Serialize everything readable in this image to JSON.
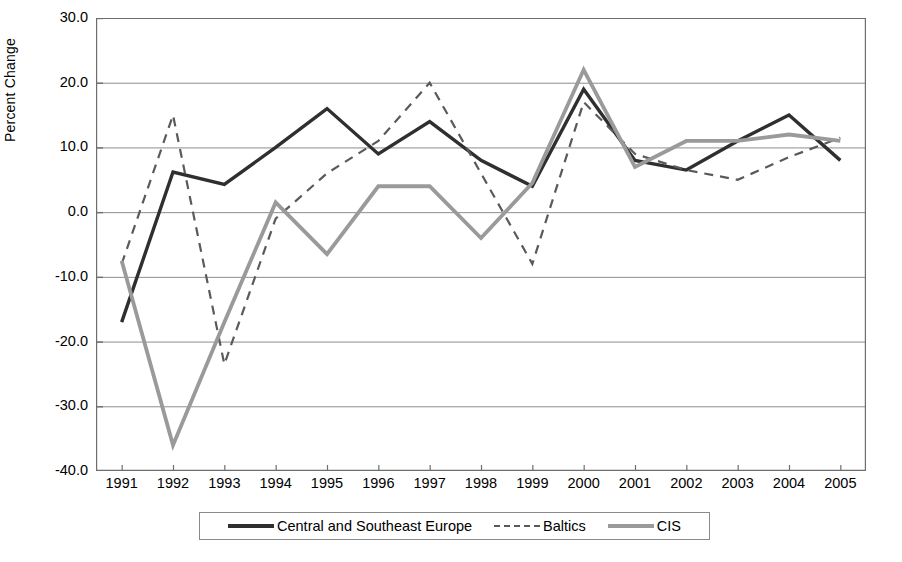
{
  "chart_data": {
    "type": "line",
    "title": "",
    "xlabel": "",
    "ylabel": "Percent Change",
    "ylim": [
      -40.0,
      30.0
    ],
    "xlim": [
      1991,
      2005
    ],
    "grid": true,
    "legend_position": "bottom",
    "ytick_labels": [
      "30.0",
      "20.0",
      "10.0",
      "0.0",
      "-10.0",
      "-20.0",
      "-30.0",
      "-40.0"
    ],
    "ytick_values": [
      30,
      20,
      10,
      0,
      -10,
      -20,
      -30,
      -40
    ],
    "categories": [
      1991,
      1992,
      1993,
      1994,
      1995,
      1996,
      1997,
      1998,
      1999,
      2000,
      2001,
      2002,
      2003,
      2004,
      2005
    ],
    "xtick_labels": [
      "1991",
      "1992",
      "1993",
      "1994",
      "1995",
      "1996",
      "1997",
      "1998",
      "1999",
      "2000",
      "2001",
      "2002",
      "2003",
      "2004",
      "2005"
    ],
    "series": [
      {
        "name": "Central and Southeast Europe",
        "style": "solid",
        "color": "#2f2f2f",
        "width": 3.4,
        "values": [
          -17.0,
          6.2,
          4.3,
          10.0,
          16.0,
          9.0,
          14.0,
          8.0,
          4.0,
          19.0,
          8.0,
          6.5,
          11.0,
          15.0,
          8.0
        ]
      },
      {
        "name": "Baltics",
        "style": "dashed",
        "color": "#5a5a5a",
        "width": 2.2,
        "values": [
          -8.0,
          15.0,
          -23.5,
          -1.0,
          6.0,
          11.0,
          20.0,
          6.0,
          -8.0,
          17.0,
          9.0,
          6.5,
          5.0,
          8.5,
          11.5
        ]
      },
      {
        "name": "CIS",
        "style": "solid",
        "color": "#9a9a9a",
        "width": 3.8,
        "values": [
          -7.5,
          -36.0,
          -17.0,
          1.5,
          -6.5,
          4.0,
          4.0,
          -4.0,
          4.5,
          22.0,
          7.0,
          11.0,
          11.0,
          12.0,
          11.0
        ]
      }
    ]
  },
  "legend": {
    "items": [
      {
        "label": "Central and Southeast Europe",
        "swatch": "solid-dark"
      },
      {
        "label": "Baltics",
        "swatch": "dashed"
      },
      {
        "label": "CIS",
        "swatch": "solid-gray"
      }
    ]
  },
  "colors": {
    "axis": "#6e6e6e",
    "grid": "#8d8d8d",
    "central_southeast_europe": "#2f2f2f",
    "baltics": "#5a5a5a",
    "cis": "#9a9a9a",
    "background": "#ffffff"
  }
}
